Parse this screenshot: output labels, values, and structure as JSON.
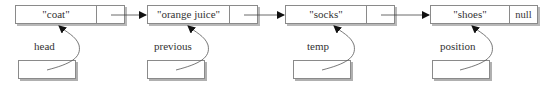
{
  "diagram": {
    "type": "singly-linked-list",
    "nodes": [
      {
        "value": "\"coat\"",
        "next": ""
      },
      {
        "value": "\"orange juice\"",
        "next": ""
      },
      {
        "value": "\"socks\"",
        "next": ""
      },
      {
        "value": "\"shoes\"",
        "next": "null"
      }
    ],
    "pointers": [
      {
        "label": "head",
        "target": 0
      },
      {
        "label": "previous",
        "target": 1
      },
      {
        "label": "temp",
        "target": 2
      },
      {
        "label": "position",
        "target": 3
      }
    ],
    "colors": {
      "line": "#444444",
      "border": "#8a8a8a",
      "shadow": "#b8b8b8"
    }
  }
}
